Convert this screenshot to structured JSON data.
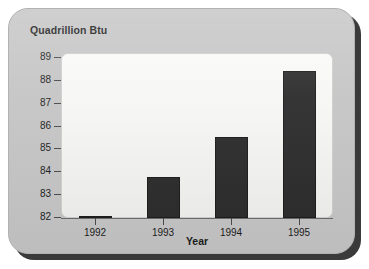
{
  "chart_data": {
    "type": "bar",
    "title": "",
    "xlabel": "Year",
    "ylabel": "Quadrillion Btu",
    "categories": [
      "1992",
      "1993",
      "1994",
      "1995"
    ],
    "values": [
      82.1,
      83.8,
      85.55,
      88.45
    ],
    "ylim": [
      82,
      89
    ],
    "yticks": [
      "82",
      "83",
      "84",
      "85",
      "86",
      "87",
      "88",
      "89"
    ],
    "ytick_values": [
      82,
      83,
      84,
      85,
      86,
      87,
      88,
      89
    ],
    "grid": false,
    "legend": false,
    "series": [
      {
        "name": "Consumption",
        "values": [
          82.1,
          83.8,
          85.55,
          88.45
        ]
      }
    ]
  },
  "colors": {
    "bar": "#2b2b2b",
    "panel": "#c5c5c5",
    "plot_background": "#f3f3f1",
    "axis": "#4a4a4a",
    "text": "#1c1c1c"
  }
}
